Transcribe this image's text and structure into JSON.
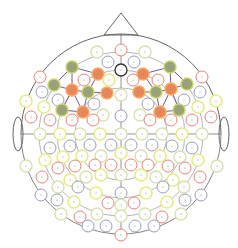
{
  "diagram": {
    "title": "EEG electrode montage (top view)",
    "head": {
      "cx": 121,
      "cy": 134,
      "r": 100
    },
    "colors": {
      "outline": "#666666",
      "green_fill": "#9aa27a",
      "green_stroke": "#c8d66a",
      "orange_fill": "#e9875a",
      "orange_stroke": "#f2b06a",
      "red": "#e8857a",
      "blue": "#9a9ec2",
      "yellow": "#e6ec8a",
      "lightgreen": "#d7e3b0",
      "black": "#333333",
      "link": "#7a5a9a"
    },
    "electrodes": [
      {
        "x": 121,
        "y": 50,
        "t": "red"
      },
      {
        "x": 97,
        "y": 52,
        "t": "lightgreen"
      },
      {
        "x": 145,
        "y": 52,
        "t": "lightgreen"
      },
      {
        "x": 108,
        "y": 62,
        "t": "blue"
      },
      {
        "x": 134,
        "y": 62,
        "t": "blue"
      },
      {
        "x": 121,
        "y": 70,
        "t": "black"
      },
      {
        "x": 72,
        "y": 67,
        "t": "green"
      },
      {
        "x": 170,
        "y": 67,
        "t": "green"
      },
      {
        "x": 98,
        "y": 74,
        "t": "orange"
      },
      {
        "x": 143,
        "y": 74,
        "t": "orange"
      },
      {
        "x": 40,
        "y": 77,
        "t": "red"
      },
      {
        "x": 202,
        "y": 77,
        "t": "red"
      },
      {
        "x": 84,
        "y": 80,
        "t": "red"
      },
      {
        "x": 109,
        "y": 80,
        "t": "yellow"
      },
      {
        "x": 133,
        "y": 80,
        "t": "red"
      },
      {
        "x": 158,
        "y": 80,
        "t": "red"
      },
      {
        "x": 54,
        "y": 85,
        "t": "green"
      },
      {
        "x": 187,
        "y": 84,
        "t": "green"
      },
      {
        "x": 72,
        "y": 90,
        "t": "orange"
      },
      {
        "x": 171,
        "y": 89,
        "t": "orange"
      },
      {
        "x": 88,
        "y": 92,
        "t": "green"
      },
      {
        "x": 156,
        "y": 92,
        "t": "green"
      },
      {
        "x": 107,
        "y": 93,
        "t": "orange"
      },
      {
        "x": 139,
        "y": 92,
        "t": "orange"
      },
      {
        "x": 121,
        "y": 95,
        "t": "lightgreen"
      },
      {
        "x": 42,
        "y": 92,
        "t": "blue"
      },
      {
        "x": 200,
        "y": 92,
        "t": "blue"
      },
      {
        "x": 26,
        "y": 101,
        "t": "yellow"
      },
      {
        "x": 216,
        "y": 101,
        "t": "yellow"
      },
      {
        "x": 44,
        "y": 107,
        "t": "yellow"
      },
      {
        "x": 198,
        "y": 107,
        "t": "yellow"
      },
      {
        "x": 58,
        "y": 100,
        "t": "blue"
      },
      {
        "x": 184,
        "y": 100,
        "t": "blue"
      },
      {
        "x": 62,
        "y": 110,
        "t": "green"
      },
      {
        "x": 179,
        "y": 110,
        "t": "green"
      },
      {
        "x": 83,
        "y": 112,
        "t": "orange"
      },
      {
        "x": 160,
        "y": 112,
        "t": "orange"
      },
      {
        "x": 94,
        "y": 104,
        "t": "blue"
      },
      {
        "x": 148,
        "y": 104,
        "t": "blue"
      },
      {
        "x": 103,
        "y": 115,
        "t": "lightgreen"
      },
      {
        "x": 140,
        "y": 115,
        "t": "lightgreen"
      },
      {
        "x": 121,
        "y": 116,
        "t": "blue"
      },
      {
        "x": 31,
        "y": 117,
        "t": "red"
      },
      {
        "x": 211,
        "y": 117,
        "t": "red"
      },
      {
        "x": 50,
        "y": 120,
        "t": "red"
      },
      {
        "x": 72,
        "y": 120,
        "t": "red"
      },
      {
        "x": 93,
        "y": 120,
        "t": "red"
      },
      {
        "x": 150,
        "y": 120,
        "t": "red"
      },
      {
        "x": 171,
        "y": 120,
        "t": "red"
      },
      {
        "x": 192,
        "y": 120,
        "t": "red"
      },
      {
        "x": 40,
        "y": 134,
        "t": "lightgreen"
      },
      {
        "x": 60,
        "y": 134,
        "t": "yellow"
      },
      {
        "x": 80,
        "y": 134,
        "t": "lightgreen"
      },
      {
        "x": 100,
        "y": 134,
        "t": "yellow"
      },
      {
        "x": 121,
        "y": 134,
        "t": "lightgreen"
      },
      {
        "x": 142,
        "y": 134,
        "t": "lightgreen"
      },
      {
        "x": 162,
        "y": 134,
        "t": "lightgreen"
      },
      {
        "x": 182,
        "y": 134,
        "t": "yellow"
      },
      {
        "x": 202,
        "y": 134,
        "t": "lightgreen"
      },
      {
        "x": 50,
        "y": 148,
        "t": "blue"
      },
      {
        "x": 70,
        "y": 146,
        "t": "blue"
      },
      {
        "x": 90,
        "y": 145,
        "t": "blue"
      },
      {
        "x": 111,
        "y": 145,
        "t": "blue"
      },
      {
        "x": 131,
        "y": 145,
        "t": "blue"
      },
      {
        "x": 152,
        "y": 145,
        "t": "blue"
      },
      {
        "x": 172,
        "y": 146,
        "t": "blue"
      },
      {
        "x": 192,
        "y": 148,
        "t": "blue"
      },
      {
        "x": 26,
        "y": 166,
        "t": "lightgreen"
      },
      {
        "x": 45,
        "y": 160,
        "t": "yellow"
      },
      {
        "x": 63,
        "y": 157,
        "t": "yellow"
      },
      {
        "x": 82,
        "y": 156,
        "t": "yellow"
      },
      {
        "x": 101,
        "y": 156,
        "t": "lightgreen"
      },
      {
        "x": 121,
        "y": 153,
        "t": "yellow"
      },
      {
        "x": 141,
        "y": 156,
        "t": "lightgreen"
      },
      {
        "x": 160,
        "y": 156,
        "t": "yellow"
      },
      {
        "x": 180,
        "y": 157,
        "t": "lightgreen"
      },
      {
        "x": 198,
        "y": 160,
        "t": "yellow"
      },
      {
        "x": 217,
        "y": 166,
        "t": "lightgreen"
      },
      {
        "x": 58,
        "y": 168,
        "t": "red"
      },
      {
        "x": 75,
        "y": 166,
        "t": "red"
      },
      {
        "x": 95,
        "y": 165,
        "t": "red"
      },
      {
        "x": 111,
        "y": 165,
        "t": "red"
      },
      {
        "x": 131,
        "y": 165,
        "t": "red"
      },
      {
        "x": 148,
        "y": 165,
        "t": "red"
      },
      {
        "x": 168,
        "y": 166,
        "t": "red"
      },
      {
        "x": 185,
        "y": 168,
        "t": "red"
      },
      {
        "x": 42,
        "y": 177,
        "t": "red"
      },
      {
        "x": 200,
        "y": 177,
        "t": "red"
      },
      {
        "x": 70,
        "y": 180,
        "t": "yellow"
      },
      {
        "x": 86,
        "y": 177,
        "t": "lightgreen"
      },
      {
        "x": 101,
        "y": 175,
        "t": "yellow"
      },
      {
        "x": 121,
        "y": 175,
        "t": "lightgreen"
      },
      {
        "x": 141,
        "y": 175,
        "t": "yellow"
      },
      {
        "x": 156,
        "y": 177,
        "t": "lightgreen"
      },
      {
        "x": 173,
        "y": 180,
        "t": "yellow"
      },
      {
        "x": 58,
        "y": 187,
        "t": "lightgreen"
      },
      {
        "x": 78,
        "y": 187,
        "t": "blue"
      },
      {
        "x": 163,
        "y": 187,
        "t": "blue"
      },
      {
        "x": 184,
        "y": 187,
        "t": "lightgreen"
      },
      {
        "x": 96,
        "y": 193,
        "t": "yellow"
      },
      {
        "x": 121,
        "y": 193,
        "t": "blue"
      },
      {
        "x": 146,
        "y": 193,
        "t": "yellow"
      },
      {
        "x": 41,
        "y": 195,
        "t": "blue"
      },
      {
        "x": 201,
        "y": 195,
        "t": "blue"
      },
      {
        "x": 57,
        "y": 200,
        "t": "blue"
      },
      {
        "x": 185,
        "y": 200,
        "t": "blue"
      },
      {
        "x": 74,
        "y": 202,
        "t": "yellow"
      },
      {
        "x": 167,
        "y": 202,
        "t": "yellow"
      },
      {
        "x": 121,
        "y": 205,
        "t": "lightgreen"
      },
      {
        "x": 108,
        "y": 203,
        "t": "red"
      },
      {
        "x": 134,
        "y": 203,
        "t": "red"
      },
      {
        "x": 61,
        "y": 214,
        "t": "lightgreen"
      },
      {
        "x": 80,
        "y": 217,
        "t": "red"
      },
      {
        "x": 97,
        "y": 214,
        "t": "lightgreen"
      },
      {
        "x": 121,
        "y": 216,
        "t": "lightgreen"
      },
      {
        "x": 145,
        "y": 214,
        "t": "lightgreen"
      },
      {
        "x": 162,
        "y": 217,
        "t": "red"
      },
      {
        "x": 181,
        "y": 214,
        "t": "lightgreen"
      },
      {
        "x": 88,
        "y": 226,
        "t": "blue"
      },
      {
        "x": 106,
        "y": 226,
        "t": "blue"
      },
      {
        "x": 135,
        "y": 226,
        "t": "blue"
      },
      {
        "x": 154,
        "y": 226,
        "t": "blue"
      },
      {
        "x": 121,
        "y": 235,
        "t": "red"
      }
    ],
    "links": [
      [
        72,
        67,
        98,
        74
      ],
      [
        72,
        67,
        54,
        85
      ],
      [
        72,
        67,
        72,
        90
      ],
      [
        54,
        85,
        72,
        90
      ],
      [
        72,
        90,
        88,
        92
      ],
      [
        88,
        92,
        107,
        93
      ],
      [
        98,
        74,
        88,
        92
      ],
      [
        72,
        90,
        62,
        110
      ],
      [
        62,
        110,
        83,
        112
      ],
      [
        88,
        92,
        83,
        112
      ],
      [
        72,
        90,
        83,
        112
      ],
      [
        170,
        67,
        143,
        74
      ],
      [
        170,
        67,
        187,
        84
      ],
      [
        170,
        67,
        171,
        89
      ],
      [
        187,
        84,
        171,
        89
      ],
      [
        171,
        89,
        156,
        92
      ],
      [
        156,
        92,
        139,
        92
      ],
      [
        143,
        74,
        156,
        92
      ],
      [
        171,
        89,
        179,
        110
      ],
      [
        179,
        110,
        160,
        112
      ],
      [
        156,
        92,
        160,
        112
      ],
      [
        171,
        89,
        160,
        112
      ]
    ]
  }
}
